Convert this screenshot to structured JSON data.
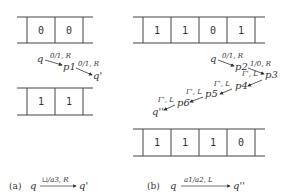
{
  "figure": {
    "panel_a": {
      "tape_before": [
        "0",
        "0"
      ],
      "tape_after": [
        "1",
        "1"
      ],
      "steps": [
        {
          "from": "q",
          "label": "0/1, R",
          "to": "p1"
        },
        {
          "from": "p1",
          "label": "0/1, R",
          "to": "q'"
        }
      ],
      "caption": {
        "tag": "(a)",
        "from": "q",
        "label": "⊔/a3, R",
        "to": "q'"
      }
    },
    "panel_b": {
      "tape_before": [
        "1",
        "1",
        "0",
        "1"
      ],
      "tape_after": [
        "1",
        "1",
        "1",
        "0"
      ],
      "steps": [
        {
          "from": "q",
          "label": "0/1, R",
          "to": "p2"
        },
        {
          "from": "p2",
          "label": "1/0, R",
          "to": "p3"
        },
        {
          "from": "p3",
          "label": "Γ', L",
          "to": "p4"
        },
        {
          "from": "p4",
          "label": "Γ', L",
          "to": "p5"
        },
        {
          "from": "p5",
          "label": "Γ', L",
          "to": "p6"
        },
        {
          "from": "p6",
          "label": "Γ', L",
          "to": "q''"
        }
      ],
      "caption": {
        "tag": "(b)",
        "from": "q",
        "label": "a1/a2, L",
        "to": "q''"
      }
    }
  }
}
